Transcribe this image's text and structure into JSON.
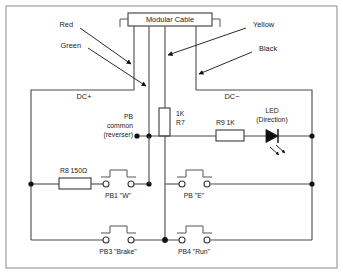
{
  "diagram": {
    "cable": {
      "label": "Modular Cable",
      "wire_count": 4
    },
    "wire_labels": {
      "red": "Red",
      "green": "Green",
      "yellow": "Yellow",
      "black": "Black"
    },
    "rails": {
      "positive": "DC+",
      "negative": "DC−"
    },
    "common": {
      "line1": "PB",
      "line2": "common",
      "line3": "(reverser)"
    },
    "components": {
      "r7": {
        "value": "1K",
        "ref": "R7"
      },
      "r8": {
        "label": "R8 150Ω"
      },
      "r9": {
        "label": "R9  1K"
      },
      "led": {
        "line1": "LED",
        "line2": "(Direction)"
      }
    },
    "pushbuttons": [
      {
        "label": "PB1 \"W\""
      },
      {
        "label": "PB \"E\""
      },
      {
        "label": "PB3 \"Brake\""
      },
      {
        "label": "PB4 \"Run\""
      }
    ],
    "colors": {
      "wire": "#4a4a4a",
      "frame": "#8a8a8a",
      "text": "#1a1a1a",
      "node": "#111111",
      "component_fill": "#ffffff"
    }
  }
}
